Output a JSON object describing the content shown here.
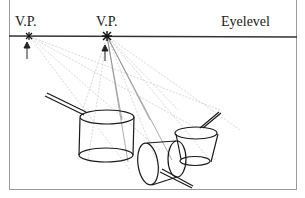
{
  "figure": {
    "labels": {
      "vp1": "V.P.",
      "vp2": "V.P.",
      "eyelevel": "Eyelevel"
    },
    "vanishing_points": [
      {
        "name": "V.P.",
        "x": 29,
        "y": 36
      },
      {
        "name": "V.P.",
        "x": 107,
        "y": 36
      }
    ],
    "horizon_y": 36,
    "objects": [
      "large saucepan",
      "small saucepan",
      "tipped-over saucepan"
    ],
    "colors": {
      "line": "#1a1a1a",
      "construction": "#b5b5b5",
      "frame": "#9a9a9a"
    }
  }
}
